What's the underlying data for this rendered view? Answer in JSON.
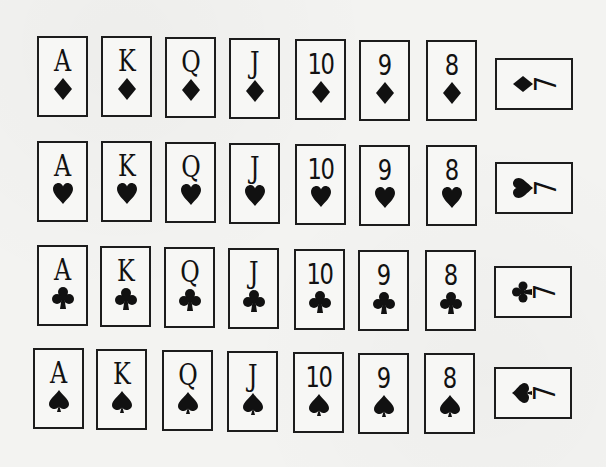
{
  "figure": {
    "rows": [
      {
        "suit": "diamonds",
        "suit_icon": "diamond-icon",
        "cards": [
          {
            "rank": "A"
          },
          {
            "rank": "K"
          },
          {
            "rank": "Q"
          },
          {
            "rank": "J"
          },
          {
            "rank": "10"
          },
          {
            "rank": "9"
          },
          {
            "rank": "8"
          }
        ],
        "rotated_card": {
          "rank": "7"
        }
      },
      {
        "suit": "hearts",
        "suit_icon": "heart-icon",
        "cards": [
          {
            "rank": "A"
          },
          {
            "rank": "K"
          },
          {
            "rank": "Q"
          },
          {
            "rank": "J"
          },
          {
            "rank": "10"
          },
          {
            "rank": "9"
          },
          {
            "rank": "8"
          }
        ],
        "rotated_card": {
          "rank": "7"
        }
      },
      {
        "suit": "clubs",
        "suit_icon": "club-icon",
        "cards": [
          {
            "rank": "A"
          },
          {
            "rank": "K"
          },
          {
            "rank": "Q"
          },
          {
            "rank": "J"
          },
          {
            "rank": "10"
          },
          {
            "rank": "9"
          },
          {
            "rank": "8"
          }
        ],
        "rotated_card": {
          "rank": "7"
        }
      },
      {
        "suit": "spades",
        "suit_icon": "spade-icon",
        "cards": [
          {
            "rank": "A"
          },
          {
            "rank": "K"
          },
          {
            "rank": "Q"
          },
          {
            "rank": "J"
          },
          {
            "rank": "10"
          },
          {
            "rank": "9"
          },
          {
            "rank": "8"
          }
        ],
        "rotated_card": {
          "rank": "7"
        }
      }
    ]
  },
  "colors": {
    "ink": "#111111",
    "paper": "#f3f3f1"
  }
}
